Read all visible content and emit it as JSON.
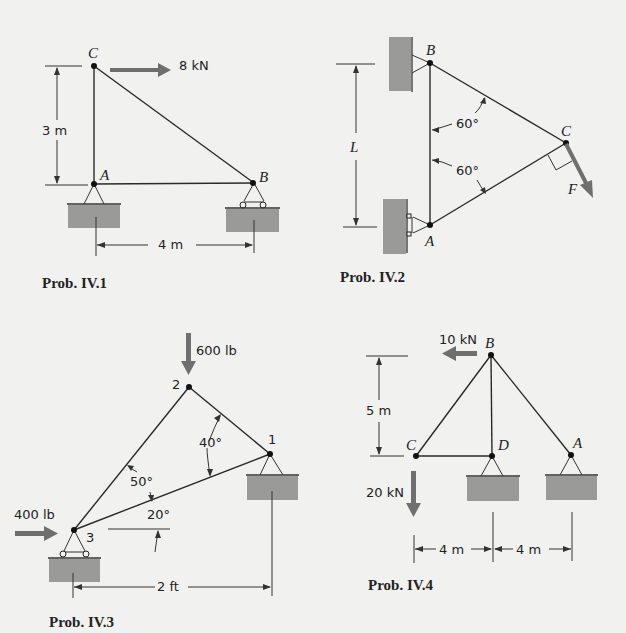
{
  "problems": [
    {
      "caption": "Prob. IV.1",
      "nodes": {
        "C": "C",
        "A": "A",
        "B": "B"
      },
      "loads": [
        {
          "label": "8 kN",
          "direction": "right",
          "at": "C"
        }
      ],
      "dimensions": [
        {
          "label": "3 m",
          "orientation": "vertical",
          "between": [
            "A",
            "C"
          ]
        },
        {
          "label": "4 m",
          "orientation": "horizontal",
          "between": [
            "A",
            "B"
          ]
        }
      ],
      "supports": [
        {
          "at": "A",
          "type": "pin"
        },
        {
          "at": "B",
          "type": "roller"
        }
      ]
    },
    {
      "caption": "Prob. IV.2",
      "nodes": {
        "B": "B",
        "A": "A",
        "C": "C"
      },
      "loads": [
        {
          "label": "F",
          "direction": "perpendicular to AC",
          "at": "C"
        }
      ],
      "angles": [
        {
          "label": "60°",
          "between": [
            "AB",
            "BC"
          ]
        },
        {
          "label": "60°",
          "between": [
            "AB",
            "AC"
          ]
        }
      ],
      "dimensions": [
        {
          "label": "L",
          "orientation": "vertical",
          "between": [
            "A",
            "B"
          ]
        }
      ],
      "supports": [
        {
          "at": "B",
          "type": "pin-wall"
        },
        {
          "at": "A",
          "type": "roller-wall"
        }
      ]
    },
    {
      "caption": "Prob. IV.3",
      "nodes": {
        "n1": "1",
        "n2": "2",
        "n3": "3"
      },
      "loads": [
        {
          "label": "600 lb",
          "direction": "down",
          "at": "2"
        },
        {
          "label": "400 lb",
          "direction": "right",
          "at": "3"
        }
      ],
      "angles": [
        {
          "label": "40°",
          "between": [
            "21",
            "31"
          ]
        },
        {
          "label": "50°",
          "between": [
            "32",
            "31"
          ]
        },
        {
          "label": "20°",
          "between": [
            "31",
            "horizontal"
          ]
        }
      ],
      "dimensions": [
        {
          "label": "2 ft",
          "orientation": "horizontal",
          "between": [
            "3",
            "1"
          ]
        }
      ],
      "supports": [
        {
          "at": "1",
          "type": "pin"
        },
        {
          "at": "3",
          "type": "roller"
        }
      ]
    },
    {
      "caption": "Prob. IV.4",
      "nodes": {
        "B": "B",
        "C": "C",
        "D": "D",
        "A": "A"
      },
      "loads": [
        {
          "label": "10 kN",
          "direction": "left",
          "at": "B"
        },
        {
          "label": "20 kN",
          "direction": "down",
          "at": "C"
        }
      ],
      "dimensions": [
        {
          "label": "5 m",
          "orientation": "vertical",
          "between": [
            "C",
            "B"
          ]
        },
        {
          "label": "4 m",
          "orientation": "horizontal",
          "between": [
            "C",
            "D"
          ]
        },
        {
          "label": "4 m",
          "orientation": "horizontal",
          "between": [
            "D",
            "A"
          ]
        }
      ],
      "supports": [
        {
          "at": "D",
          "type": "pin"
        },
        {
          "at": "A",
          "type": "pin"
        }
      ]
    }
  ],
  "colors": {
    "background": "#f1f1ef",
    "ground": "#9a9a98",
    "force_arrow": "#6f6f6f",
    "line": "#2a2a2a"
  }
}
